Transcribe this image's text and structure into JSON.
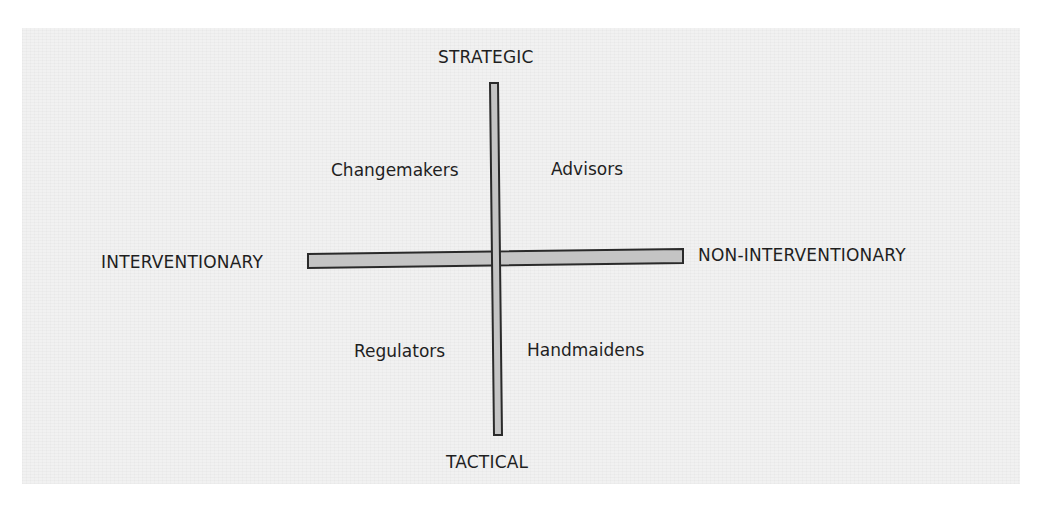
{
  "diagram": {
    "type": "quadrant-matrix",
    "axes": {
      "vertical": {
        "top_label": "STRATEGIC",
        "bottom_label": "TACTICAL"
      },
      "horizontal": {
        "left_label": "INTERVENTIONARY",
        "right_label": "NON-INTERVENTIONARY"
      }
    },
    "quadrants": {
      "top_left": "Changemakers",
      "top_right": "Advisors",
      "bottom_left": "Regulators",
      "bottom_right": "Handmaidens"
    },
    "colors": {
      "background": "#f1f1f1",
      "axis_fill": "#c4c4c4",
      "axis_stroke": "#2a2a2a",
      "text": "#1f1f1f"
    }
  }
}
